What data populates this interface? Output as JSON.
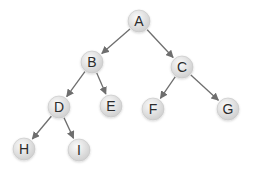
{
  "diagram": {
    "type": "binary-tree",
    "colors": {
      "edge": "#6e6e6e",
      "node_fill_light": "#fafafa",
      "node_fill_dark": "#cfcfcf",
      "node_stroke": "#c4c4c4",
      "label": "#2b2b2b"
    },
    "nodes": [
      {
        "id": "A",
        "label": "A",
        "x": 139,
        "y": 21
      },
      {
        "id": "B",
        "label": "B",
        "x": 92,
        "y": 62
      },
      {
        "id": "C",
        "label": "C",
        "x": 182,
        "y": 67
      },
      {
        "id": "D",
        "label": "D",
        "x": 59,
        "y": 107
      },
      {
        "id": "E",
        "label": "E",
        "x": 111,
        "y": 106
      },
      {
        "id": "F",
        "label": "F",
        "x": 153,
        "y": 109
      },
      {
        "id": "G",
        "label": "G",
        "x": 228,
        "y": 109
      },
      {
        "id": "H",
        "label": "H",
        "x": 24,
        "y": 149
      },
      {
        "id": "I",
        "label": "I",
        "x": 79,
        "y": 150
      }
    ],
    "edges": [
      {
        "from": "A",
        "to": "B"
      },
      {
        "from": "A",
        "to": "C"
      },
      {
        "from": "B",
        "to": "D"
      },
      {
        "from": "B",
        "to": "E"
      },
      {
        "from": "C",
        "to": "F"
      },
      {
        "from": "C",
        "to": "G"
      },
      {
        "from": "D",
        "to": "H"
      },
      {
        "from": "D",
        "to": "I"
      }
    ]
  }
}
